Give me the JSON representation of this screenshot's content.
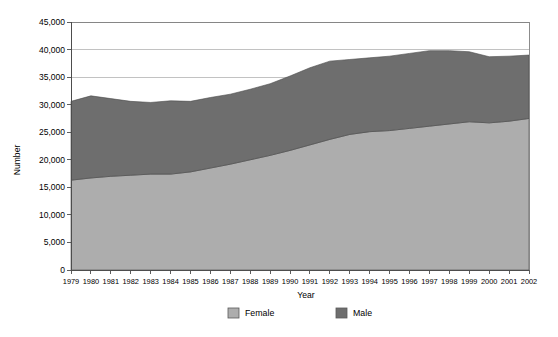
{
  "chart_data": {
    "type": "area",
    "stacked": true,
    "title": "",
    "xlabel": "Year",
    "ylabel": "Number",
    "categories": [
      "1979",
      "1980",
      "1981",
      "1982",
      "1983",
      "1984",
      "1985",
      "1986",
      "1987",
      "1988",
      "1989",
      "1990",
      "1991",
      "1992",
      "1993",
      "1994",
      "1995",
      "1996",
      "1997",
      "1998",
      "1999",
      "2000",
      "2001",
      "2002"
    ],
    "series": [
      {
        "name": "Female",
        "color": "#adadad",
        "values": [
          16300,
          16700,
          17000,
          17200,
          17400,
          17400,
          17800,
          18500,
          19200,
          20000,
          20800,
          21700,
          22700,
          23700,
          24600,
          25100,
          25300,
          25700,
          26100,
          26500,
          26900,
          26700,
          27000,
          27500
        ]
      },
      {
        "name": "Male",
        "color": "#6e6e6e",
        "values": [
          14300,
          14900,
          14100,
          13400,
          13000,
          13300,
          12800,
          12800,
          12700,
          12800,
          13000,
          13500,
          14000,
          14200,
          13600,
          13400,
          13500,
          13600,
          13700,
          13300,
          12700,
          12000,
          11800,
          11500
        ]
      }
    ],
    "totals": [
      30600,
      31600,
      31100,
      30600,
      30400,
      30700,
      30600,
      31300,
      31900,
      32800,
      33800,
      35200,
      36700,
      37900,
      38200,
      38500,
      38800,
      39300,
      39800,
      39800,
      39600,
      38700,
      38800,
      39000
    ],
    "ylim": [
      0,
      45000
    ],
    "y_ticks": [
      "0",
      "5,000",
      "10,000",
      "15,000",
      "20,000",
      "25,000",
      "30,000",
      "35,000",
      "40,000",
      "45,000"
    ],
    "y_tick_values": [
      0,
      5000,
      10000,
      15000,
      20000,
      25000,
      30000,
      35000,
      40000,
      45000
    ],
    "grid": true,
    "legend_position": "bottom",
    "legend": [
      {
        "label": "Female",
        "color": "#adadad"
      },
      {
        "label": "Male",
        "color": "#6e6e6e"
      }
    ]
  }
}
